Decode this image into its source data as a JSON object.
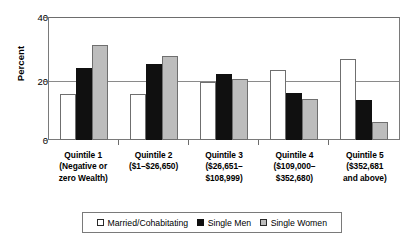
{
  "chart_data": {
    "type": "bar",
    "title": "",
    "subtitle": "",
    "xlabel": "",
    "ylabel": "Percent",
    "ylim": [
      0,
      40
    ],
    "yticks": [
      "0",
      "20",
      "40"
    ],
    "ytick_values": [
      0,
      20,
      40
    ],
    "grid": "horizontal",
    "legend_position": "bottom",
    "categories": [
      "Quintile 1\n(Negative or\nzero Wealth)",
      "Quintile 2\n($1–$26,650)",
      "Quintile 3\n($26,651–\n$108,999)",
      "Quintile 4\n($109,000–\n$352,680)",
      "Quintile 5\n($352,681\nand above)"
    ],
    "category_lines": [
      [
        "Quintile 1",
        "(Negative or",
        "zero Wealth)"
      ],
      [
        "Quintile 2",
        "($1–$26,650)"
      ],
      [
        "Quintile 3",
        "($26,651–",
        "$108,999)"
      ],
      [
        "Quintile 4",
        "($109,000–",
        "$352,680)"
      ],
      [
        "Quintile 5",
        "($352,681",
        "and above)"
      ]
    ],
    "series": [
      {
        "name": "Married/Cohabitating",
        "color": "#ffffff",
        "values": [
          15,
          15,
          19,
          23,
          26.5
        ]
      },
      {
        "name": "Single Men",
        "color": "#101010",
        "values": [
          23.5,
          25,
          21.5,
          15.5,
          13
        ]
      },
      {
        "name": "Single Women",
        "color": "#bdbdbd",
        "values": [
          31,
          27.5,
          20,
          13.5,
          6
        ]
      }
    ]
  },
  "legend": {
    "items": [
      {
        "label": "Married/Cohabitating",
        "swatch": "white-square-icon"
      },
      {
        "label": "Single Men",
        "swatch": "black-square-icon"
      },
      {
        "label": "Single Women",
        "swatch": "gray-square-icon"
      }
    ]
  },
  "axis": {
    "y_title": "Percent",
    "y_tick_labels": [
      "40",
      "20",
      "0"
    ]
  }
}
